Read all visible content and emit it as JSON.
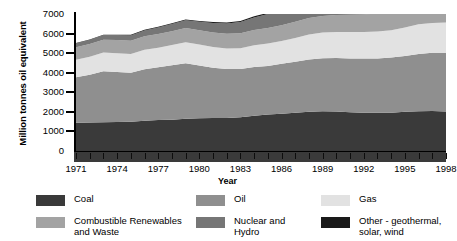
{
  "chart_data": {
    "type": "area",
    "title": "",
    "subtitle": "",
    "xlabel": "Year",
    "ylabel": "Million tonnes oil equivalent",
    "xlim": [
      1971,
      1998
    ],
    "ylim": [
      0,
      7000
    ],
    "grid": false,
    "stacked": true,
    "legend_position": "bottom",
    "y_ticks": [
      0,
      1000,
      2000,
      3000,
      4000,
      5000,
      6000,
      7000
    ],
    "y_tick_labels": [
      "0",
      "1000",
      "2000",
      "3000",
      "4000",
      "5000",
      "6000",
      "7000"
    ],
    "x_ticks": [
      1971,
      1974,
      1977,
      1980,
      1983,
      1986,
      1989,
      1992,
      1995,
      1998
    ],
    "x_tick_labels": [
      "1971",
      "1974",
      "1977",
      "1980",
      "1983",
      "1986",
      "1989",
      "1992",
      "1995",
      "1998"
    ],
    "x": [
      1971,
      1972,
      1973,
      1974,
      1975,
      1976,
      1977,
      1978,
      1979,
      1980,
      1981,
      1982,
      1983,
      1984,
      1985,
      1986,
      1987,
      1988,
      1989,
      1990,
      1991,
      1992,
      1993,
      1994,
      1995,
      1996,
      1997,
      1998
    ],
    "series": [
      {
        "name": "Coal",
        "color": "#3a3a3a",
        "values": [
          1440,
          1450,
          1470,
          1480,
          1500,
          1550,
          1580,
          1600,
          1650,
          1670,
          1680,
          1690,
          1730,
          1800,
          1870,
          1900,
          1960,
          2010,
          2030,
          2020,
          1980,
          1950,
          1950,
          1960,
          2000,
          2030,
          2040,
          2020
        ]
      },
      {
        "name": "Oil",
        "color": "#8f8f8f",
        "values": [
          2330,
          2450,
          2600,
          2560,
          2500,
          2630,
          2700,
          2780,
          2830,
          2700,
          2580,
          2500,
          2460,
          2490,
          2470,
          2560,
          2600,
          2670,
          2710,
          2730,
          2740,
          2770,
          2770,
          2820,
          2860,
          2920,
          2980,
          3000
        ]
      },
      {
        "name": "Gas",
        "color": "#e2e2e2",
        "values": [
          890,
          920,
          960,
          960,
          950,
          990,
          1000,
          1030,
          1080,
          1070,
          1060,
          1050,
          1060,
          1110,
          1150,
          1160,
          1220,
          1270,
          1310,
          1330,
          1360,
          1360,
          1390,
          1390,
          1450,
          1520,
          1520,
          1550
        ]
      },
      {
        "name": "Combustible Renewables and Waste",
        "color": "#a3a3a3",
        "values": [
          640,
          650,
          660,
          670,
          680,
          690,
          700,
          710,
          720,
          730,
          740,
          750,
          770,
          780,
          800,
          810,
          820,
          840,
          850,
          870,
          880,
          900,
          910,
          930,
          950,
          960,
          980,
          1000
        ]
      },
      {
        "name": "Nuclear and Hydro",
        "color": "#767676",
        "values": [
          190,
          200,
          220,
          240,
          270,
          300,
          330,
          370,
          400,
          430,
          480,
          520,
          570,
          640,
          710,
          760,
          800,
          840,
          870,
          890,
          920,
          930,
          950,
          970,
          990,
          1010,
          1030,
          1050
        ]
      },
      {
        "name": "Other - geothermal, solar, wind",
        "color": "#1a1a1a",
        "values": [
          30,
          30,
          32,
          34,
          36,
          38,
          40,
          42,
          45,
          48,
          50,
          53,
          56,
          60,
          63,
          66,
          70,
          73,
          76,
          80,
          83,
          86,
          90,
          94,
          98,
          102,
          106,
          110
        ]
      }
    ],
    "totals": [
      5520,
      5700,
      5942,
      5944,
      5936,
      6198,
      6350,
      6532,
      6725,
      6648,
      6590,
      6563,
      6646,
      6880,
      7063,
      7256,
      7470,
      7703,
      7846,
      7920,
      7963,
      7996,
      8060,
      8164,
      8348,
      8542,
      8656,
      8730
    ]
  },
  "axis": {
    "y_title": "Million tonnes oil equivalent",
    "x_title": "Year"
  },
  "legend": {
    "items": [
      {
        "label": "Coal",
        "color": "#3a3a3a"
      },
      {
        "label": "Oil",
        "color": "#8f8f8f"
      },
      {
        "label": "Gas",
        "color": "#e2e2e2"
      },
      {
        "label": "Combustible Renewables\nand Waste",
        "color": "#a3a3a3"
      },
      {
        "label": "Nuclear and\nHydro",
        "color": "#767676"
      },
      {
        "label": "Other - geothermal,\nsolar, wind",
        "color": "#1a1a1a"
      }
    ]
  }
}
